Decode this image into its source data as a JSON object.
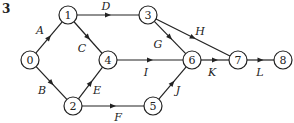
{
  "problem_number": "3",
  "nodes": [
    {
      "id": "0",
      "x": 30,
      "y": 60
    },
    {
      "id": "1",
      "x": 68,
      "y": 15
    },
    {
      "id": "2",
      "x": 73,
      "y": 106
    },
    {
      "id": "3",
      "x": 148,
      "y": 15
    },
    {
      "id": "4",
      "x": 108,
      "y": 60
    },
    {
      "id": "5",
      "x": 153,
      "y": 106
    },
    {
      "id": "6",
      "x": 192,
      "y": 60
    },
    {
      "id": "7",
      "x": 238,
      "y": 60
    },
    {
      "id": "8",
      "x": 283,
      "y": 60
    }
  ],
  "edges": [
    {
      "label": "A",
      "from": "0",
      "to": "1",
      "lx": 40,
      "ly": 34
    },
    {
      "label": "B",
      "from": "0",
      "to": "2",
      "lx": 42,
      "ly": 94
    },
    {
      "label": "C",
      "from": "1",
      "to": "4",
      "lx": 82,
      "ly": 52
    },
    {
      "label": "D",
      "from": "1",
      "to": "3",
      "lx": 106,
      "ly": 10
    },
    {
      "label": "E",
      "from": "2",
      "to": "4",
      "lx": 97,
      "ly": 94
    },
    {
      "label": "F",
      "from": "2",
      "to": "5",
      "lx": 118,
      "ly": 121
    },
    {
      "label": "G",
      "from": "3",
      "to": "6",
      "lx": 158,
      "ly": 48
    },
    {
      "label": "H",
      "from": "3",
      "to": "7",
      "lx": 200,
      "ly": 35
    },
    {
      "label": "I",
      "from": "4",
      "to": "6",
      "lx": 146,
      "ly": 76
    },
    {
      "label": "J",
      "from": "5",
      "to": "6",
      "lx": 178,
      "ly": 94
    },
    {
      "label": "K",
      "from": "6",
      "to": "7",
      "lx": 212,
      "ly": 76
    },
    {
      "label": "L",
      "from": "7",
      "to": "8",
      "lx": 260,
      "ly": 76
    }
  ]
}
